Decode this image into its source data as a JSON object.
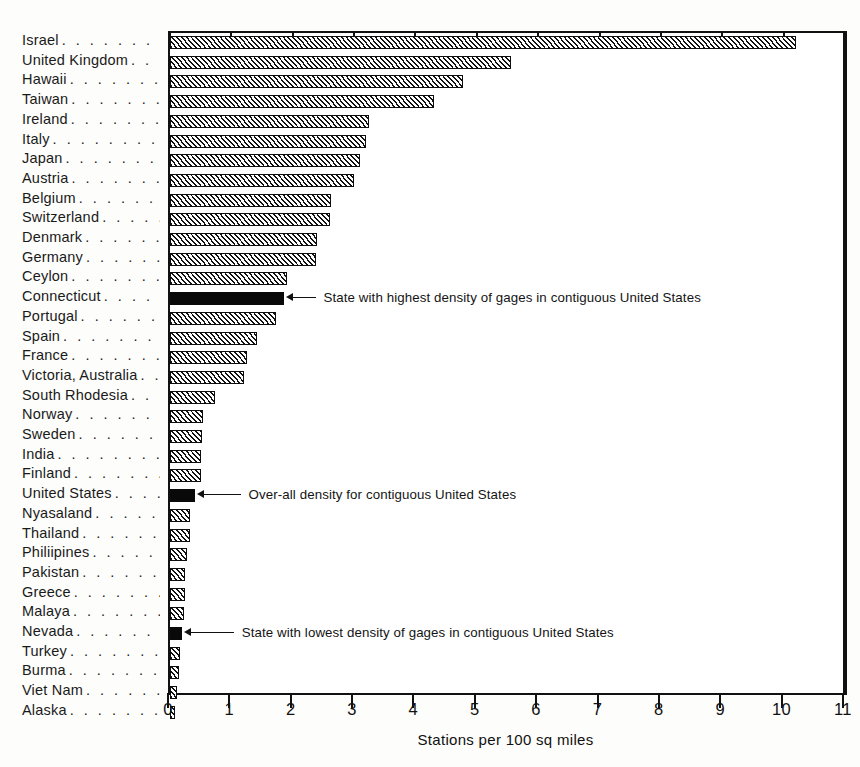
{
  "chart_data": {
    "type": "bar",
    "orientation": "horizontal",
    "title": "",
    "xlabel": "Stations per 100 sq miles",
    "ylabel": "",
    "xlim": [
      0,
      11
    ],
    "xticks": [
      "0",
      "1",
      "2",
      "3",
      "4",
      "5",
      "6",
      "7",
      "8",
      "9",
      "10",
      "11"
    ],
    "grid": false,
    "legend": "none",
    "categories": [
      "Israel",
      "United Kingdom",
      "Hawaii",
      "Taiwan",
      "Ireland",
      "Italy",
      "Japan",
      "Austria",
      "Belgium",
      "Switzerland",
      "Denmark",
      "Germany",
      "Ceylon",
      "Connecticut",
      "Portugal",
      "Spain",
      "France",
      "Victoria, Australia",
      "South Rhodesia",
      "Norway",
      "Sweden",
      "India",
      "Finland",
      "United States",
      "Nyasaland",
      "Thailand",
      "Philiipines",
      "Pakistan",
      "Greece",
      "Malaya",
      "Nevada",
      "Turkey",
      "Burma",
      "Viet Nam",
      "Alaska"
    ],
    "values": [
      10.2,
      5.55,
      4.78,
      4.3,
      3.25,
      3.2,
      3.1,
      3.0,
      2.62,
      2.6,
      2.4,
      2.38,
      1.9,
      1.85,
      1.72,
      1.42,
      1.25,
      1.2,
      0.73,
      0.54,
      0.52,
      0.5,
      0.5,
      0.4,
      0.33,
      0.32,
      0.27,
      0.25,
      0.24,
      0.22,
      0.19,
      0.17,
      0.14,
      0.11,
      0.08
    ],
    "highlighted": [
      "Connecticut",
      "United States",
      "Nevada"
    ],
    "bar_fill_default": "diagonal-hatch",
    "bar_fill_highlight": "solid-black",
    "annotations": [
      {
        "category": "Connecticut",
        "text": "State with highest density of gages in contiguous United States"
      },
      {
        "category": "United States",
        "text": "Over-all density for contiguous United States"
      },
      {
        "category": "Nevada",
        "text": "State with lowest density of gages in contiguous United States"
      }
    ],
    "label_leader": ". . . . . . . . . . . . . . . . . . . .",
    "colors": {
      "axis": "#111111",
      "bar_outline": "#0d0d0d",
      "bar_hatch": "#111111",
      "bar_highlight": "#090909",
      "background": "#fdfdfb",
      "text": "#141414"
    }
  }
}
